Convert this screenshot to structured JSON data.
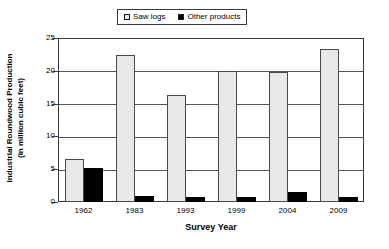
{
  "chart_data": {
    "type": "bar",
    "title": "",
    "xlabel": "Survey Year",
    "ylabel": "Industrial Roundwood Production",
    "ylabel_line2": "(in million cubic feet)",
    "categories": [
      "1962",
      "1983",
      "1993",
      "1999",
      "2004",
      "2009"
    ],
    "series": [
      {
        "name": "Saw logs",
        "color": "#e8e8e8",
        "values": [
          6.6,
          22.4,
          16.3,
          20.0,
          19.8,
          23.3
        ]
      },
      {
        "name": "Other products",
        "color": "#000000",
        "values": [
          5.2,
          0.9,
          0.7,
          0.8,
          1.6,
          0.8
        ]
      }
    ],
    "ylim": [
      0,
      25
    ],
    "yticks": [
      0,
      5,
      10,
      15,
      20,
      25
    ],
    "ytick_labels": [
      "0",
      "5",
      "10",
      "15",
      "20",
      "25"
    ],
    "grid": true,
    "legend_position": "top-center"
  },
  "legend": {
    "items": [
      {
        "label": "Saw logs",
        "swatch": "open-square-icon"
      },
      {
        "label": "Other products",
        "swatch": "filled-square-icon"
      }
    ]
  }
}
